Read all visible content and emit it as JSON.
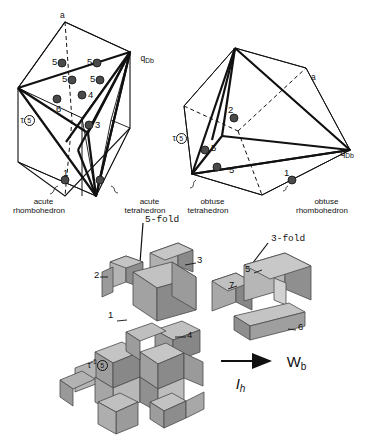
{
  "figure": {
    "background_color": "#ffffff",
    "line_color": "#111111",
    "node_fill": "#4a4a4a",
    "facet_light": "#b8b8b8",
    "facet_mid": "#9a9a9a",
    "facet_dark": "#6f6f6f"
  },
  "panels": {
    "left": {
      "name": "acute-rhombohedron-panel",
      "vertex_labels": {
        "top": "a",
        "right": "q",
        "right_sub": "D",
        "right_sub2": "b"
      },
      "tau_label": {
        "tau": "τ",
        "circled": "5"
      },
      "node_numbers": [
        "5",
        "5",
        "5",
        "5",
        "6",
        "4",
        "3",
        "1",
        "2"
      ],
      "captions": {
        "left": [
          "acute",
          "rhombohedron"
        ],
        "right": [
          "acute",
          "tetrahedron"
        ]
      }
    },
    "right": {
      "name": "obtuse-rhombohedron-panel",
      "vertex_labels": {
        "edge": "a",
        "right": "q",
        "right_sub": "D",
        "right_sub2": "b"
      },
      "tau_label": {
        "tau": "τ",
        "circled": "5"
      },
      "node_numbers": [
        "2",
        "5",
        "5",
        "1"
      ],
      "captions": {
        "left": [
          "obtuse",
          "tetrahedron"
        ],
        "right": [
          "obtuse",
          "rhombohedron"
        ]
      }
    },
    "bottom": {
      "name": "exploded-rhombic-assembly-panel",
      "axis_labels": {
        "five_fold": "5-fold",
        "three_fold": "3-fold"
      },
      "piece_numbers": [
        "1",
        "2",
        "3",
        "4",
        "5",
        "6",
        "7"
      ],
      "tau_label": {
        "tau": "τ",
        "sup": "-1",
        "circled": "5"
      },
      "arrow": {
        "head_label": "W",
        "head_sub": "b",
        "tail_label": "I",
        "tail_sub": "h"
      }
    }
  }
}
